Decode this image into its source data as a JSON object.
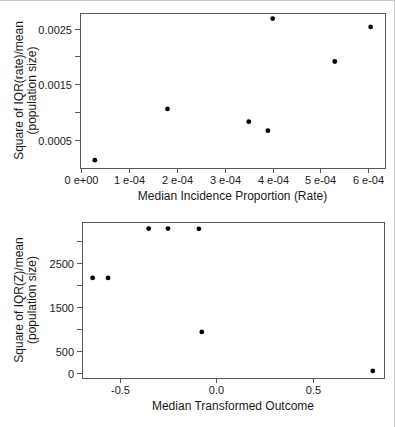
{
  "figure": {
    "width": 395,
    "height": 427,
    "background": "#ffffff"
  },
  "style": {
    "axis_color": "#5a5a5a",
    "text_color": "#1a1a1a",
    "point_color": "#000000",
    "tick_font_px": 11,
    "label_font_px": 12,
    "tick_len": 5,
    "point_radius": 2.4
  },
  "chart_data": [
    {
      "type": "scatter",
      "title": "",
      "xlabel": "Median Incidence Proportion (Rate)",
      "ylabel_lines": [
        "Square of IQR(rate)/mean",
        "(population size)"
      ],
      "xlim": [
        -3e-06,
        0.000635
      ],
      "ylim": [
        0,
        0.00278
      ],
      "grid": false,
      "legend": null,
      "xticks": {
        "values": [
          0,
          0.0001,
          0.0002,
          0.0003,
          0.0004,
          0.0005,
          0.0006
        ],
        "labels": [
          "0 e+00",
          "1 e-04",
          "2 e-04",
          "3 e-04",
          "4 e-04",
          "5 e-04",
          "6 e-04"
        ]
      },
      "yticks": {
        "values": [
          0.0005,
          0.001,
          0.0015,
          0.002,
          0.0025
        ],
        "labels": [
          "0.0005",
          "",
          "0.0015",
          "",
          "0.0025"
        ]
      },
      "points": [
        {
          "x": 2.8e-05,
          "y": 0.00014
        },
        {
          "x": 0.00018,
          "y": 0.00106
        },
        {
          "x": 0.00035,
          "y": 0.00083
        },
        {
          "x": 0.00039,
          "y": 0.00067
        },
        {
          "x": 0.0004,
          "y": 0.00268
        },
        {
          "x": 0.00053,
          "y": 0.00191
        },
        {
          "x": 0.000605,
          "y": 0.00253
        }
      ],
      "layout": {
        "box": {
          "left": 80,
          "top": 12,
          "width": 305,
          "height": 155
        },
        "ylabel_x": [
          23,
          36
        ]
      }
    },
    {
      "type": "scatter",
      "title": "",
      "xlabel": "Median Transformed Outcome",
      "ylabel_lines": [
        "Square of IQR(Z)/mean",
        "(population size)"
      ],
      "xlim": [
        -0.695,
        0.868
      ],
      "ylim": [
        -120,
        3420
      ],
      "grid": false,
      "legend": null,
      "xticks": {
        "values": [
          -0.5,
          0,
          0.5
        ],
        "labels": [
          "-0.5",
          "0.0",
          "0.5"
        ]
      },
      "yticks": {
        "values": [
          0,
          500,
          1000,
          1500,
          2000,
          2500,
          3000
        ],
        "labels": [
          "0",
          "500",
          "",
          "1500",
          "",
          "2500",
          ""
        ]
      },
      "points": [
        {
          "x": -0.64,
          "y": 2150
        },
        {
          "x": -0.56,
          "y": 2150
        },
        {
          "x": -0.35,
          "y": 3270
        },
        {
          "x": -0.25,
          "y": 3270
        },
        {
          "x": -0.09,
          "y": 3265
        },
        {
          "x": -0.075,
          "y": 925
        },
        {
          "x": 0.81,
          "y": 40
        }
      ],
      "layout": {
        "box": {
          "left": 82,
          "top": 221,
          "width": 302,
          "height": 156
        },
        "ylabel_x": [
          23,
          36
        ]
      }
    }
  ]
}
